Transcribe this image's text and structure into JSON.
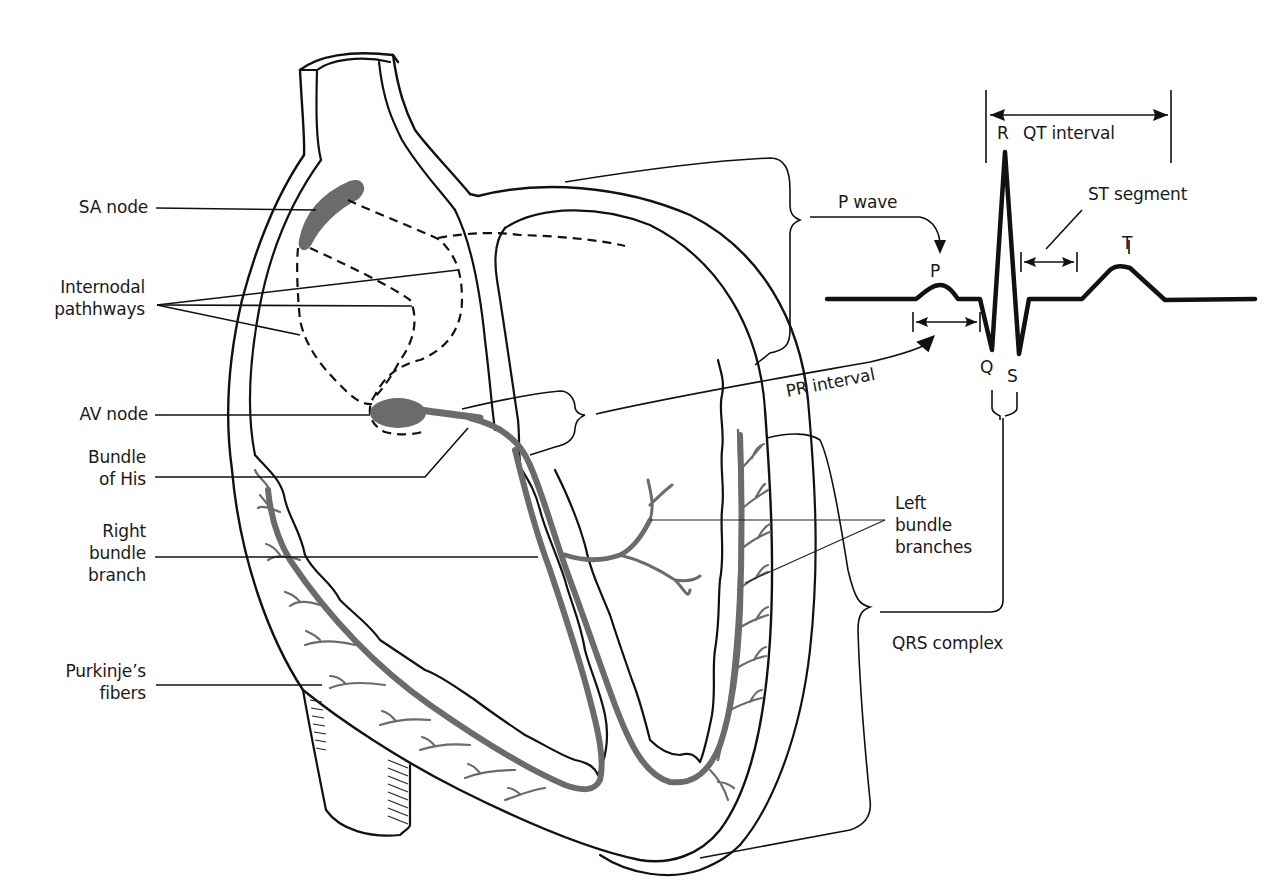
{
  "diagram": {
    "colors": {
      "ink": "#111111",
      "conduction_tissue": "#6b6b6b",
      "background": "#ffffff"
    },
    "heart_labels": [
      {
        "id": "sa-node",
        "lines": [
          "SA node"
        ]
      },
      {
        "id": "internodal-pathways",
        "lines": [
          "Internodal",
          "pathhways"
        ]
      },
      {
        "id": "av-node",
        "lines": [
          "AV node"
        ]
      },
      {
        "id": "bundle-of-his",
        "lines": [
          "Bundle",
          "of His"
        ]
      },
      {
        "id": "right-bundle-branch",
        "lines": [
          "Right",
          "bundle",
          "branch"
        ]
      },
      {
        "id": "purkinje-fibers",
        "lines": [
          "Purkinje’s",
          "fibers"
        ]
      },
      {
        "id": "left-bundle-branches",
        "lines": [
          "Left",
          "bundle",
          "branches"
        ]
      }
    ],
    "ecg": {
      "wave_labels": {
        "p": "P",
        "q": "Q",
        "r": "R",
        "s": "S",
        "t": "T"
      },
      "annotations": {
        "p_wave": "P wave",
        "pr_interval": "PR interval",
        "qrs_complex": "QRS complex",
        "st_segment": "ST segment",
        "qt_interval": "QT interval"
      }
    }
  }
}
